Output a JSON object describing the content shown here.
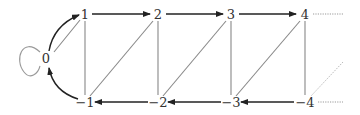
{
  "diagram": {
    "type": "directed-graph",
    "nodes": [
      {
        "id": "n0",
        "label": "0",
        "x": 46,
        "y": 59
      },
      {
        "id": "p1",
        "label": "1",
        "x": 85,
        "y": 15
      },
      {
        "id": "p2",
        "label": "2",
        "x": 158,
        "y": 15
      },
      {
        "id": "p3",
        "label": "3",
        "x": 231,
        "y": 15
      },
      {
        "id": "p4",
        "label": "4",
        "x": 305,
        "y": 15
      },
      {
        "id": "m1",
        "label": "−1",
        "x": 85,
        "y": 103
      },
      {
        "id": "m2",
        "label": "−2",
        "x": 158,
        "y": 103
      },
      {
        "id": "m3",
        "label": "−3",
        "x": 231,
        "y": 103
      },
      {
        "id": "m4",
        "label": "−4",
        "x": 305,
        "y": 103
      }
    ],
    "edges": [
      {
        "from": "n0",
        "to": "n0",
        "kind": "loop"
      },
      {
        "from": "n0",
        "to": "p1",
        "kind": "arrow-curved"
      },
      {
        "from": "m1",
        "to": "n0",
        "kind": "arrow-curved"
      },
      {
        "from": "n0",
        "to": "p1",
        "kind": "line"
      },
      {
        "from": "p1",
        "to": "p2",
        "kind": "arrow"
      },
      {
        "from": "p2",
        "to": "p3",
        "kind": "arrow"
      },
      {
        "from": "p3",
        "to": "p4",
        "kind": "arrow"
      },
      {
        "from": "m2",
        "to": "m1",
        "kind": "arrow"
      },
      {
        "from": "m3",
        "to": "m2",
        "kind": "arrow"
      },
      {
        "from": "m4",
        "to": "m3",
        "kind": "arrow"
      },
      {
        "from": "p1",
        "to": "m1",
        "kind": "line"
      },
      {
        "from": "p2",
        "to": "m2",
        "kind": "line"
      },
      {
        "from": "p3",
        "to": "m3",
        "kind": "line"
      },
      {
        "from": "p4",
        "to": "m4",
        "kind": "line"
      },
      {
        "from": "p2",
        "to": "m1",
        "kind": "line"
      },
      {
        "from": "p3",
        "to": "m2",
        "kind": "line"
      },
      {
        "from": "p4",
        "to": "m3",
        "kind": "line"
      },
      {
        "from": "m4",
        "to": "beyond",
        "kind": "dotted-line"
      },
      {
        "from": "p4",
        "to": "beyond",
        "kind": "dotted"
      },
      {
        "from": "m4",
        "to": "beyond",
        "kind": "dotted"
      }
    ]
  },
  "labels": {
    "n0": "0",
    "p1": "1",
    "p2": "2",
    "p3": "3",
    "p4": "4",
    "m1": "−1",
    "m2": "−2",
    "m3": "−3",
    "m4": "−4"
  },
  "colors": {
    "arrow": "#222222",
    "line": "#888888",
    "dotted": "#999999",
    "text": "#333333"
  }
}
